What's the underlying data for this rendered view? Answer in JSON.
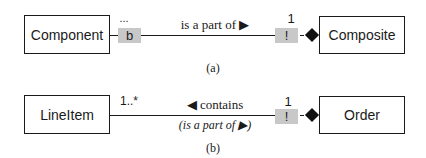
{
  "diagram_a": {
    "left_class": "Component",
    "right_class": "Composite",
    "left_multiplicity": "...",
    "left_marker": "b",
    "right_multiplicity": "1",
    "right_marker": "!",
    "association_label": "is a part of ▶",
    "caption": "(a)"
  },
  "diagram_b": {
    "left_class": "LineItem",
    "right_class": "Order",
    "left_multiplicity": "1..*",
    "right_multiplicity": "1",
    "right_marker": "!",
    "association_label": "◀ contains",
    "association_sublabel": "(is a part of ▶)",
    "caption": "(b)"
  }
}
